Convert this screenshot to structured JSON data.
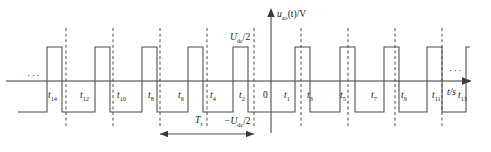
{
  "figure": {
    "type": "pwm-waveform-timing-diagram",
    "y_axis_label": "u",
    "y_axis_label_sub": "ao",
    "y_axis_label_rest": "(t)/V",
    "x_axis_label": "t/s",
    "level_high_label": "U",
    "level_high_sub": "dc",
    "level_high_rest": "/2",
    "level_low_label": "−U",
    "level_low_sub": "dc",
    "level_low_rest": "/2",
    "period_label": "T",
    "period_sub": "s",
    "origin_label": "0",
    "ellipsis_left": "···",
    "ellipsis_right": "···",
    "colors": {
      "stroke": "#4a4a4a",
      "axis": "#3a3a3a",
      "dashed": "#3a3a3a",
      "text": "#1a1a1a",
      "background": "#ffffff"
    }
  },
  "time_labels": [
    {
      "text": "t",
      "sub": "14",
      "x": 48,
      "y": 91
    },
    {
      "text": "t",
      "sub": "12",
      "x": 80,
      "y": 91
    },
    {
      "text": "t",
      "sub": "10",
      "x": 117,
      "y": 91
    },
    {
      "text": "t",
      "sub": "8",
      "x": 148,
      "y": 91
    },
    {
      "text": "t",
      "sub": "6",
      "x": 178,
      "y": 91
    },
    {
      "text": "t",
      "sub": "4",
      "x": 210,
      "y": 91
    },
    {
      "text": "t",
      "sub": "2",
      "x": 239,
      "y": 91
    },
    {
      "text": "0",
      "sub": "",
      "x": 263,
      "y": 91
    },
    {
      "text": "t",
      "sub": "1",
      "x": 284,
      "y": 91
    },
    {
      "text": "t",
      "sub": "3",
      "x": 307,
      "y": 91
    },
    {
      "text": "t",
      "sub": "5",
      "x": 340,
      "y": 91
    },
    {
      "text": "t",
      "sub": "7",
      "x": 371,
      "y": 91
    },
    {
      "text": "t",
      "sub": "9",
      "x": 401,
      "y": 91
    },
    {
      "text": "t",
      "sub": "11",
      "x": 432,
      "y": 91
    }
  ],
  "time_labels_far": [
    {
      "text": "t",
      "sub": "13",
      "x": 458,
      "y": 91
    }
  ],
  "chart_data": {
    "type": "line",
    "title": "",
    "xlabel": "t/s",
    "ylabel": "u_ao(t)/V",
    "ylim": [
      -1,
      1
    ],
    "ytick_labels": [
      "U_dc/2",
      "-U_dc/2"
    ],
    "baseline_y": 81,
    "high_y": 47,
    "low_y": 112,
    "axis_x": 271,
    "axis_top_y": 14,
    "axis_right_x": 468,
    "waveform_start_x": 18,
    "waveform_end_x": 470,
    "pulse_edges": [
      18,
      47,
      62,
      95,
      110,
      142,
      157,
      188,
      203,
      233,
      248,
      295,
      310,
      340,
      355,
      384,
      399,
      427,
      442,
      466
    ],
    "dashed_lines_x": [
      66,
      113,
      160,
      207,
      254,
      301,
      348,
      395,
      442
    ],
    "dashed_top_y": 28,
    "dashed_bottom_y": 128,
    "period_arrow": {
      "x1": 160,
      "x2": 254,
      "y": 134,
      "label_x": 198,
      "label_y": 120
    }
  }
}
